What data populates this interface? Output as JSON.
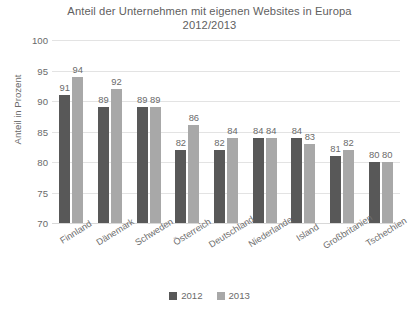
{
  "chart_data": {
    "type": "bar",
    "title": "Anteil der Unternehmen mit eigenen Websites in Europa 2012/2013",
    "title_line1": "Anteil der Unternehmen mit eigenen Websites in Europa",
    "title_line2": "2012/2013",
    "xlabel": "",
    "ylabel": "Anteil in Prozent",
    "ylim": [
      70,
      100
    ],
    "yticks": [
      100,
      95,
      90,
      85,
      80,
      75,
      70
    ],
    "grid": true,
    "legend_position": "bottom",
    "categories": [
      "Finnland",
      "Dänemark",
      "Schweden",
      "Österreich",
      "Deutschland",
      "Niederlande",
      "Island",
      "Großbritanien",
      "Tschechien"
    ],
    "series": [
      {
        "name": "2012",
        "color": "#585858",
        "values": [
          91,
          89,
          89,
          82,
          82,
          84,
          84,
          81,
          80
        ]
      },
      {
        "name": "2013",
        "color": "#a8a8a8",
        "values": [
          94,
          92,
          89,
          86,
          84,
          84,
          83,
          82,
          80
        ]
      }
    ]
  },
  "legend": {
    "items": [
      {
        "label": "2012",
        "color": "#585858"
      },
      {
        "label": "2013",
        "color": "#a8a8a8"
      }
    ]
  }
}
